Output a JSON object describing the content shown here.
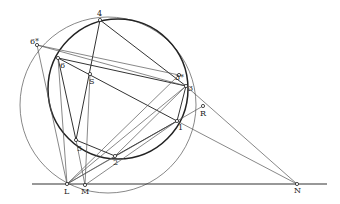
{
  "diagram": {
    "points": {
      "p4": {
        "label": "4",
        "x": 100,
        "y": 20
      },
      "p6s": {
        "label": "6*",
        "x": 37,
        "y": 45
      },
      "p6": {
        "label": "6",
        "x": 58,
        "y": 58
      },
      "pS": {
        "label": "S",
        "x": 90,
        "y": 74
      },
      "p3s": {
        "label": "3*",
        "x": 179,
        "y": 75
      },
      "p3": {
        "label": "3",
        "x": 186,
        "y": 86
      },
      "pR": {
        "label": "R",
        "x": 203,
        "y": 106
      },
      "p1": {
        "label": "1",
        "x": 177,
        "y": 121
      },
      "p5": {
        "label": "5",
        "x": 76,
        "y": 140
      },
      "p2": {
        "label": "2",
        "x": 115,
        "y": 156
      },
      "pL": {
        "label": "L",
        "x": 67,
        "y": 184
      },
      "pM": {
        "label": "M",
        "x": 85,
        "y": 185
      },
      "pN": {
        "label": "N",
        "x": 297,
        "y": 184
      }
    },
    "circles": [
      {
        "name": "thick-circle",
        "cx": 118,
        "cy": 89,
        "r": 70
      },
      {
        "name": "thin-circle",
        "cx": 108,
        "cy": 105,
        "r": 88
      }
    ],
    "baseline": {
      "x1": 32,
      "y1": 184,
      "x2": 327,
      "y2": 184
    }
  }
}
